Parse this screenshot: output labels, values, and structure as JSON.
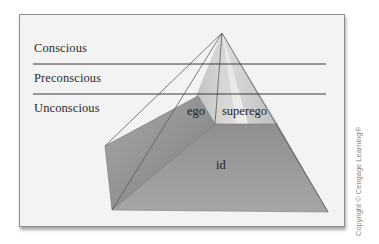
{
  "diagram": {
    "type": "pyramid",
    "levels": [
      {
        "label": "Conscious"
      },
      {
        "label": "Preconscious"
      },
      {
        "label": "Unconscious"
      }
    ],
    "structures": {
      "ego": "ego",
      "superego": "superego",
      "id": "id"
    },
    "copyright": "Copyright © Cengage Learning®",
    "colors": {
      "frame_bg": "#f3f3f3",
      "frame_border": "#8e8e8e",
      "id_face": "#9a9a9a",
      "left_facet": "#8f8f8f",
      "line": "#3a3a3a"
    }
  }
}
